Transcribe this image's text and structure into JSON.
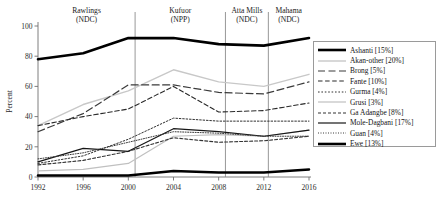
{
  "chart_data": {
    "type": "line",
    "title": "",
    "xlabel": "",
    "ylabel": "Percent",
    "x": [
      1992,
      1996,
      2000,
      2004,
      2008,
      2012,
      2016
    ],
    "xticks": [
      "1992",
      "1996",
      "2000",
      "2004",
      "2008",
      "2012",
      "2016"
    ],
    "yticks": [
      "0",
      "20",
      "40",
      "60",
      "80",
      "100"
    ],
    "xlim": [
      1992,
      2016
    ],
    "ylim": [
      0,
      100
    ],
    "grid": false,
    "legend_position": "right",
    "series": [
      {
        "name": "Ashanti",
        "share": "15%",
        "label": "Ashanti [15%]",
        "style": "solid-thick",
        "color": "#000000",
        "width": 2.6,
        "values": [
          78,
          82,
          92,
          92,
          88,
          87,
          92
        ]
      },
      {
        "name": "Akan-other",
        "share": "20%",
        "label": "Akan-other [20%]",
        "style": "solid-light",
        "color": "#c8c8c8",
        "width": 1.4,
        "values": [
          34,
          48,
          57,
          71,
          63,
          60,
          68
        ]
      },
      {
        "name": "Brong",
        "share": "5%",
        "label": "Brong [5%]",
        "style": "long-dash",
        "color": "#3a3a3a",
        "width": 1.2,
        "values": [
          30,
          42,
          61,
          61,
          56,
          55,
          63
        ]
      },
      {
        "name": "Fante",
        "share": "10%",
        "label": "Fante [10%]",
        "style": "dash",
        "color": "#2a2a2a",
        "width": 1.1,
        "values": [
          34,
          40,
          45,
          60,
          43,
          44,
          49
        ]
      },
      {
        "name": "Gurma",
        "share": "4%",
        "label": "Gurma [4%]",
        "style": "dot",
        "color": "#303030",
        "width": 1.0,
        "values": [
          9,
          14,
          25,
          39,
          37,
          37,
          37
        ]
      },
      {
        "name": "Grusi",
        "share": "3%",
        "label": "Grusi [3%]",
        "style": "solid-light",
        "color": "#c0c0c0",
        "width": 1.2,
        "values": [
          4,
          5,
          9,
          27,
          28,
          27,
          31
        ]
      },
      {
        "name": "Ga Adangbe",
        "share": "8%",
        "label": "Ga Adangbe [8%]",
        "style": "short-dash",
        "color": "#333333",
        "width": 1.1,
        "values": [
          8,
          11,
          17,
          26,
          23,
          24,
          27
        ]
      },
      {
        "name": "Mole-Dagbani",
        "share": "17%",
        "label": "Mole-Dagbani [17%]",
        "style": "solid-thin",
        "color": "#161616",
        "width": 1.2,
        "values": [
          10,
          19,
          17,
          32,
          30,
          27,
          31
        ]
      },
      {
        "name": "Guan",
        "share": "4%",
        "label": "Guan [4%]",
        "style": "fine-dot",
        "color": "#3a3a3a",
        "width": 1.0,
        "values": [
          12,
          16,
          23,
          30,
          29,
          27,
          27
        ]
      },
      {
        "name": "Ewe",
        "share": "13%",
        "label": "Ewe [13%]",
        "style": "solid-thick",
        "color": "#000000",
        "width": 2.6,
        "values": [
          1,
          1,
          1,
          4,
          3,
          3,
          5
        ]
      }
    ],
    "regimes": [
      {
        "leader": "Rawlings",
        "party": "(NDC)",
        "start": 1992,
        "end": 2000.6
      },
      {
        "leader": "Kufuor",
        "party": "(NPP)",
        "start": 2000.6,
        "end": 2008.6
      },
      {
        "leader": "Atta Mills",
        "party": "(NDC)",
        "start": 2008.6,
        "end": 2012.4
      },
      {
        "leader": "Mahama",
        "party": "(NDC)",
        "start": 2012.4,
        "end": 2016
      }
    ]
  }
}
